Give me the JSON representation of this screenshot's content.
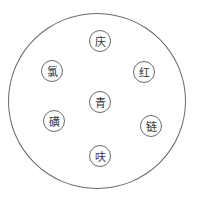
{
  "diagram": {
    "outer_circle": {
      "stroke": "#6a6a6a"
    },
    "nodes": [
      {
        "label": "庆",
        "x": 89,
        "y": 30
      },
      {
        "label": "氯",
        "x": 41,
        "y": 60
      },
      {
        "label": "红",
        "x": 133,
        "y": 61
      },
      {
        "label": "青",
        "x": 89,
        "y": 91
      },
      {
        "label": "磺",
        "x": 43,
        "y": 110
      },
      {
        "label": "链",
        "x": 140,
        "y": 115
      },
      {
        "label": "呋",
        "x": 89,
        "y": 145
      }
    ],
    "caption": ""
  }
}
